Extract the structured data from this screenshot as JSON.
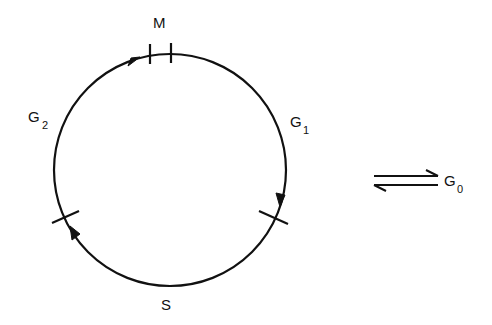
{
  "diagram": {
    "type": "cell-cycle",
    "colors": {
      "stroke": "#111111",
      "background": "#ffffff"
    },
    "phases": {
      "M": {
        "label": "M"
      },
      "G1": {
        "label": "G",
        "subscript": "1"
      },
      "S": {
        "label": "S"
      },
      "G2": {
        "label": "G",
        "subscript": "2"
      }
    },
    "quiescent": {
      "label": "G",
      "subscript": "0",
      "arrows": "reversible-harpoons"
    }
  }
}
